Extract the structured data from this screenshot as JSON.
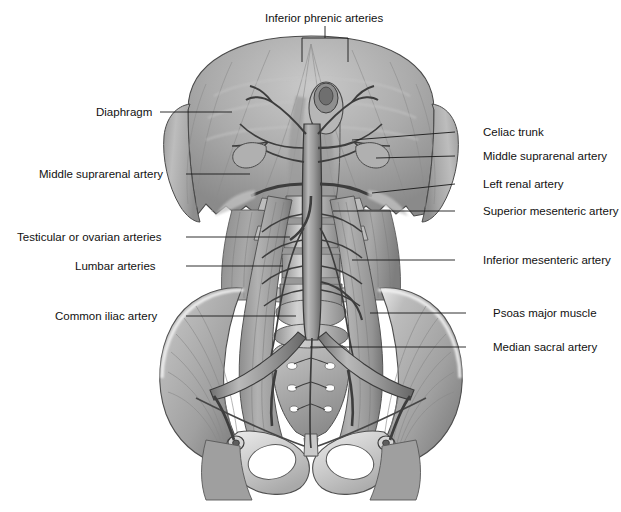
{
  "figure": {
    "background_color": "#ffffff",
    "text_color": "#111111",
    "leader_color": "#1a1a1a",
    "width": 621,
    "height": 512
  },
  "labels": {
    "inferior_phrenic_arteries": "Inferior phrenic arteries",
    "diaphragm": "Diaphragm",
    "middle_suprarenal_artery_left": "Middle suprarenal artery",
    "testicular_or_ovarian_arteries": "Testicular or ovarian arteries",
    "lumbar_arteries": "Lumbar arteries",
    "common_iliac_artery": "Common iliac artery",
    "celiac_trunk": "Celiac trunk",
    "middle_suprarenal_artery_right": "Middle suprarenal artery",
    "left_renal_artery": "Left renal artery",
    "superior_mesenteric_artery": "Superior mesenteric artery",
    "inferior_mesenteric_artery": "Inferior mesenteric artery",
    "psoas_major_muscle": "Psoas major muscle",
    "median_sacral_artery": "Median sacral artery"
  },
  "label_positions": {
    "inferior_phrenic_arteries": {
      "x": 265,
      "y": 12,
      "side": "center"
    },
    "diaphragm": {
      "x": 96,
      "y": 106,
      "side": "left"
    },
    "middle_suprarenal_artery_left": {
      "x": 39,
      "y": 168,
      "side": "left"
    },
    "testicular_or_ovarian_arteries": {
      "x": 17,
      "y": 231,
      "side": "left"
    },
    "lumbar_arteries": {
      "x": 75,
      "y": 260,
      "side": "left"
    },
    "common_iliac_artery": {
      "x": 55,
      "y": 310,
      "side": "left"
    },
    "celiac_trunk": {
      "x": 483,
      "y": 126,
      "side": "right"
    },
    "middle_suprarenal_artery_right": {
      "x": 483,
      "y": 150,
      "side": "right"
    },
    "left_renal_artery": {
      "x": 483,
      "y": 178,
      "side": "right"
    },
    "superior_mesenteric_artery": {
      "x": 483,
      "y": 205,
      "side": "right"
    },
    "inferior_mesenteric_artery": {
      "x": 483,
      "y": 254,
      "side": "right"
    },
    "psoas_major_muscle": {
      "x": 493,
      "y": 307,
      "side": "right"
    },
    "median_sacral_artery": {
      "x": 493,
      "y": 341,
      "side": "right"
    }
  },
  "anatomy": {
    "structures": [
      "diaphragm",
      "esophageal-hiatus",
      "abdominal-aorta",
      "celiac-trunk",
      "superior-mesenteric-artery",
      "renal-arteries",
      "middle-suprarenal-arteries",
      "inferior-phrenic-arteries",
      "lumbar-arteries",
      "testicular-ovarian-arteries",
      "inferior-mesenteric-artery",
      "median-sacral-artery",
      "common-iliac-arteries",
      "external-iliac-arteries",
      "internal-iliac-arteries",
      "psoas-major-muscle",
      "iliacus-muscle",
      "quadratus-lumborum",
      "lumbar-vertebrae",
      "sacrum",
      "hip-bone",
      "pubic-symphysis",
      "obturator-foramen",
      "inguinal-ligament"
    ],
    "palette": {
      "muscle_light": "#cfcfcf",
      "muscle_mid": "#a8a8a8",
      "muscle_dark": "#7d7d7d",
      "muscle_deep": "#5e5e5e",
      "bone_light": "#e8e8e8",
      "bone_mid": "#c4c4c4",
      "vessel_light": "#b4b4b4",
      "vessel_dark": "#4a4a4a",
      "outline": "#3a3a3a",
      "highlight": "#f2f2f2"
    }
  }
}
